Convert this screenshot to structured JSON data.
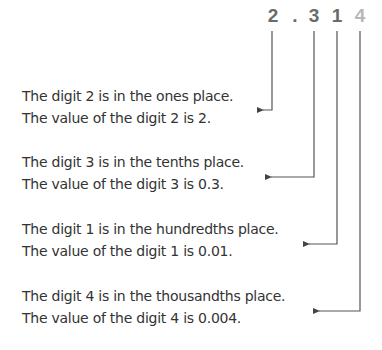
{
  "number": {
    "digits": [
      {
        "char": "2",
        "x": 273,
        "highlight": false
      },
      {
        "char": ".",
        "x": 295,
        "highlight": false
      },
      {
        "char": "3",
        "x": 314,
        "highlight": false
      },
      {
        "char": "1",
        "x": 337,
        "highlight": false
      },
      {
        "char": "4",
        "x": 360,
        "highlight": true
      }
    ]
  },
  "explanations": [
    {
      "place_line": "The digit 2 is in the ones place.",
      "value_line": "The value of the digit 2 is 2."
    },
    {
      "place_line": "The digit 3 is in the tenths place.",
      "value_line": "The value of the digit 3 is 0.3."
    },
    {
      "place_line": "The digit 1 is in the hundredths place.",
      "value_line": "The value of the digit 1 is 0.01."
    },
    {
      "place_line": "The digit 4 is in the thousandths place.",
      "value_line": "The value of the digit 4 is 0.004."
    }
  ],
  "colors": {
    "digit": "#6b6b6b",
    "digit_highlight": "#b8b8b8",
    "text": "#333333",
    "connector": "#444444"
  }
}
